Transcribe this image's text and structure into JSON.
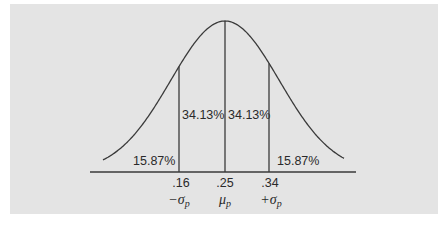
{
  "figure": {
    "type": "normal-distribution",
    "background_color": "#e4e4e4",
    "line_color": "#3a3a3a",
    "regions": [
      {
        "id": "left-tail",
        "label": "15.87%"
      },
      {
        "id": "left-center",
        "label": "34.13%"
      },
      {
        "id": "right-center",
        "label": "34.13%"
      },
      {
        "id": "right-tail",
        "label": "15.87%"
      }
    ],
    "axis": {
      "ticks": [
        {
          "value": ".16",
          "symbol": "−σ",
          "subscript": "p"
        },
        {
          "value": ".25",
          "symbol": "μ",
          "subscript": "p"
        },
        {
          "value": ".34",
          "symbol": "+σ",
          "subscript": "p"
        }
      ]
    }
  },
  "chart_data": {
    "type": "area",
    "title": "",
    "mean": 0.25,
    "std_dev": 0.09,
    "x_ticks": [
      0.16,
      0.25,
      0.34
    ],
    "x_tick_labels": [
      ".16",
      ".25",
      ".34"
    ],
    "x_symbol_labels": [
      "−σp",
      "μp",
      "+σp"
    ],
    "region_percentages": [
      15.87,
      34.13,
      34.13,
      15.87
    ],
    "region_bounds": [
      [
        "-inf",
        0.16
      ],
      [
        0.16,
        0.25
      ],
      [
        0.25,
        0.34
      ],
      [
        0.34,
        "inf"
      ]
    ],
    "grid": false,
    "legend": null
  }
}
